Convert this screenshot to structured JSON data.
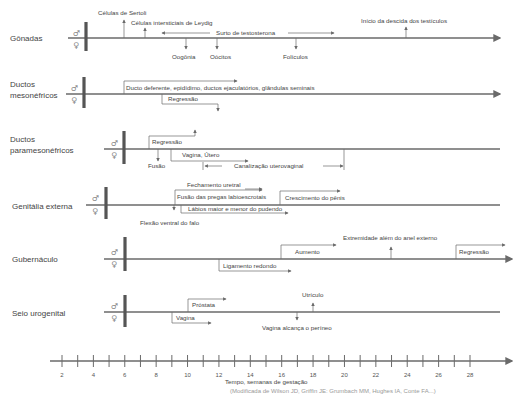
{
  "rows": [
    {
      "label": "Gônadas",
      "male": "♂",
      "female": "♀",
      "annotations": {
        "sertoli": "Células de Sertoli",
        "leydig": "Células intersticiais de Leydig",
        "testosterone": "Surto de testosterona",
        "descent": "Início da descida dos testículos",
        "oogonia": "Oogônia",
        "oocytes": "Oócitos",
        "follicles": "Folículos"
      }
    },
    {
      "label_line1": "Ductos",
      "label_line2": "mesonéfricos",
      "male": "♂",
      "female": "♀",
      "annotations": {
        "male_ducts": "Ducto deferente, epidídimo, ductos ejaculatórios, glândulas seminais",
        "regression": "Regressão"
      }
    },
    {
      "label_line1": "Ductos",
      "label_line2": "paramesonéfricos",
      "male": "♂",
      "female": "♀",
      "annotations": {
        "regression": "Regressão",
        "fusion": "Fusão",
        "vagina_uterus": "Vagina, Útero",
        "canalization": "Canalização uterovaginal"
      }
    },
    {
      "label": "Genitália externa",
      "male": "♂",
      "female": "♀",
      "annotations": {
        "urethral_closure": "Fechamento uretral",
        "labioscrotal_fusion": "Fusão das pregas labioescrotais",
        "penis_growth": "Crescimento do pênis",
        "labia": "Lábios maior e menor do pudendo",
        "ventral_flexion": "Flexão ventral do falo"
      }
    },
    {
      "label": "Gubernáculo",
      "male": "♂",
      "female": "♀",
      "annotations": {
        "increase": "Aumento",
        "beyond_ring": "Extremidade além do anel externo",
        "regression": "Regressão",
        "round_ligament": "Ligamento redondo"
      }
    },
    {
      "label": "Seio urogenital",
      "male": "♂",
      "female": "♀",
      "annotations": {
        "prostate": "Próstata",
        "utricle": "Utrículo",
        "vagina": "Vagina",
        "vagina_perineum": "Vagina alcança o períneo"
      }
    }
  ],
  "timeline": {
    "ticks": [
      "2",
      "4",
      "6",
      "8",
      "10",
      "12",
      "14",
      "16",
      "18",
      "20",
      "22",
      "24",
      "26",
      "28"
    ],
    "label": "Tempo, semanas de gestação"
  },
  "footer": "(Modificada de Wilson JD, Griffin JE: Grumbach MM, Hughes IA, Conte FA...)"
}
